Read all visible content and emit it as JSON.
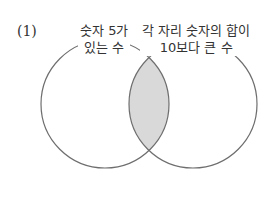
{
  "problem_number": "(1)",
  "sets": {
    "left": {
      "line1": "숫자 5가",
      "line2": "있는 수"
    },
    "right": {
      "line1": "각 자리 숫자의 합이",
      "line2": "10보다 큰 수"
    }
  },
  "colors": {
    "stroke": "#6e6e6e",
    "intersection_fill": "#d9d9d9",
    "background": "#ffffff"
  },
  "shaded_region": "intersection"
}
